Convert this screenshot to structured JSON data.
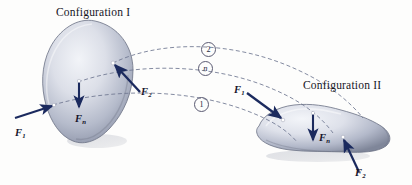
{
  "figure": {
    "background_color": "#fdfdfc",
    "body_fill_light": "#e9ecf2",
    "body_fill_mid": "#aeb4c6",
    "body_fill_dark": "#7d8499",
    "body_outline": "#6b7184",
    "arrow_color": "#1b2a5e",
    "dash_color": "#6e7690",
    "dot_color": "#ffffff"
  },
  "titles": {
    "config_1": "Configuration I",
    "config_2": "Configuration II"
  },
  "paths": [
    {
      "id": "path-2",
      "label": "2",
      "style": "numeral"
    },
    {
      "id": "path-n",
      "label": "n",
      "style": "italic"
    },
    {
      "id": "path-1",
      "label": "1",
      "style": "numeral"
    }
  ],
  "body_1": {
    "name": "Configuration I",
    "forces": [
      {
        "id": "b1-f1",
        "symbol": "F",
        "subscript": "1",
        "direction": "up-right"
      },
      {
        "id": "b1-fn",
        "symbol": "F",
        "subscript": "n",
        "direction": "down"
      },
      {
        "id": "b1-f2",
        "symbol": "F",
        "subscript": "2",
        "direction": "up-left"
      }
    ]
  },
  "body_2": {
    "name": "Configuration II",
    "forces": [
      {
        "id": "b2-f1",
        "symbol": "F",
        "subscript": "1",
        "direction": "down-right"
      },
      {
        "id": "b2-fn",
        "symbol": "F",
        "subscript": "n",
        "direction": "down"
      },
      {
        "id": "b2-f2",
        "symbol": "F",
        "subscript": "2",
        "direction": "up"
      }
    ]
  }
}
